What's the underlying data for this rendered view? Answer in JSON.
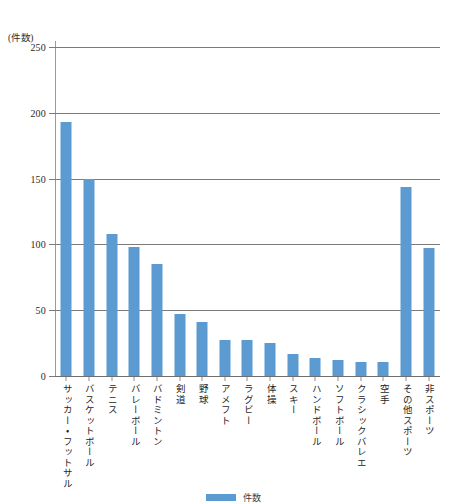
{
  "chart_data": {
    "type": "bar",
    "title": "",
    "subtitle": "",
    "xlabel": "",
    "ylabel": "(件数)",
    "ylim": [
      0,
      250
    ],
    "yticks": [
      0,
      50,
      100,
      150,
      200,
      250
    ],
    "ytick_labels": [
      "0",
      "50",
      "100",
      "150",
      "200",
      "250"
    ],
    "grid": true,
    "legend_position": "bottom",
    "series_color": "#5b9bd1",
    "categories": [
      "サッカー・フットサル",
      "バスケットボール",
      "テニス",
      "バレーボール",
      "バドミントン",
      "剣道",
      "野球",
      "アメフト",
      "ラグビー",
      "体操",
      "スキー",
      "ハンドボール",
      "ソフトボール",
      "クラシックバレエ",
      "空手",
      "その他スポーツ",
      "非スポーツ"
    ],
    "values": [
      193,
      150,
      108,
      98,
      85,
      47,
      41,
      27,
      27,
      25,
      17,
      14,
      12,
      11,
      11,
      144,
      97
    ],
    "series": [
      {
        "name": "件数",
        "color": "#5b9bd1",
        "values": [
          193,
          150,
          108,
          98,
          85,
          47,
          41,
          27,
          27,
          25,
          17,
          14,
          12,
          11,
          11,
          144,
          97
        ]
      }
    ]
  },
  "legend": {
    "label": "件数",
    "swatch_color": "#5b9bd1"
  },
  "axis": {
    "y_unit_caption": "(件数)"
  }
}
